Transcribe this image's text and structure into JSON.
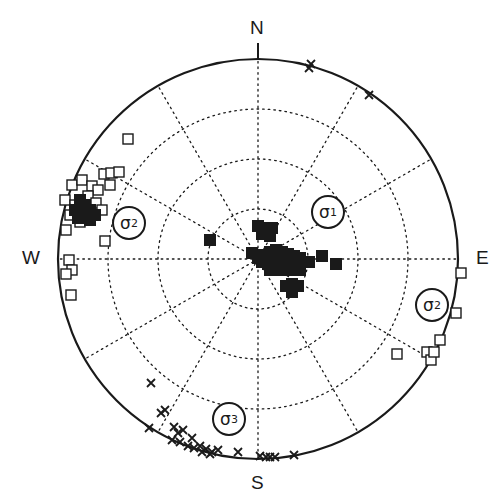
{
  "diagram": {
    "type": "stereonet",
    "projection": "lower-hemisphere equal-area",
    "center": [
      258,
      259
    ],
    "radius": 200,
    "grid_rings": [
      50,
      100,
      150
    ],
    "grid_spoke_step_deg": 30,
    "colors": {
      "ink": "#1a1a1a",
      "background": "#ffffff"
    }
  },
  "labels": {
    "north": "N",
    "south": "S",
    "east": "E",
    "west": "W"
  },
  "stress_labels": [
    {
      "id": "sigma1",
      "symbol": "σ",
      "sub": "1",
      "x": 328,
      "y": 212
    },
    {
      "id": "sigma2-west",
      "symbol": "σ",
      "sub": "2",
      "x": 129,
      "y": 223
    },
    {
      "id": "sigma2-east",
      "symbol": "σ",
      "sub": "2",
      "x": 432,
      "y": 305
    },
    {
      "id": "sigma3",
      "symbol": "σ",
      "sub": "3",
      "x": 229,
      "y": 419
    }
  ],
  "legend_markers": {
    "square": "open square (sigma1/sigma2 axes)",
    "cross": "cross (sigma3 axes)"
  },
  "points": {
    "squares_open": [
      [
        128,
        139
      ],
      [
        104,
        174
      ],
      [
        111,
        173
      ],
      [
        119,
        172
      ],
      [
        110,
        185
      ],
      [
        72,
        185
      ],
      [
        82,
        180
      ],
      [
        92,
        186
      ],
      [
        98,
        190
      ],
      [
        88,
        196
      ],
      [
        65,
        200
      ],
      [
        75,
        205
      ],
      [
        96,
        203
      ],
      [
        102,
        210
      ],
      [
        70,
        215
      ],
      [
        80,
        222
      ],
      [
        66,
        230
      ],
      [
        105,
        241
      ],
      [
        69,
        260
      ],
      [
        72,
        270
      ],
      [
        66,
        274
      ],
      [
        71,
        295
      ],
      [
        461,
        273
      ],
      [
        456,
        313
      ],
      [
        440,
        340
      ],
      [
        427,
        352
      ],
      [
        431,
        360
      ],
      [
        397,
        354
      ],
      [
        434,
        352
      ]
    ],
    "squares_dense_cluster": [
      [
        80,
        200
      ],
      [
        85,
        205
      ],
      [
        90,
        210
      ],
      [
        85,
        215
      ],
      [
        90,
        220
      ],
      [
        75,
        210
      ],
      [
        95,
        215
      ],
      [
        78,
        218
      ],
      [
        258,
        226
      ],
      [
        265,
        228
      ],
      [
        272,
        228
      ],
      [
        262,
        234
      ],
      [
        270,
        236
      ],
      [
        210,
        240
      ],
      [
        252,
        253
      ],
      [
        258,
        258
      ],
      [
        264,
        255
      ],
      [
        270,
        252
      ],
      [
        276,
        250
      ],
      [
        282,
        252
      ],
      [
        288,
        254
      ],
      [
        294,
        256
      ],
      [
        300,
        258
      ],
      [
        262,
        262
      ],
      [
        268,
        264
      ],
      [
        275,
        262
      ],
      [
        281,
        262
      ],
      [
        288,
        262
      ],
      [
        295,
        264
      ],
      [
        302,
        262
      ],
      [
        270,
        270
      ],
      [
        278,
        270
      ],
      [
        286,
        270
      ],
      [
        294,
        270
      ],
      [
        300,
        270
      ],
      [
        286,
        286
      ],
      [
        292,
        284
      ],
      [
        298,
        286
      ],
      [
        292,
        292
      ],
      [
        322,
        256
      ],
      [
        336,
        264
      ],
      [
        309,
        262
      ]
    ],
    "crosses": [
      [
        311,
        64
      ],
      [
        309,
        68
      ],
      [
        369,
        95
      ],
      [
        151,
        383
      ],
      [
        161,
        413
      ],
      [
        165,
        410
      ],
      [
        174,
        427
      ],
      [
        178,
        433
      ],
      [
        183,
        430
      ],
      [
        192,
        438
      ],
      [
        149,
        428
      ],
      [
        172,
        440
      ],
      [
        180,
        442
      ],
      [
        188,
        446
      ],
      [
        194,
        448
      ],
      [
        200,
        446
      ],
      [
        206,
        449
      ],
      [
        212,
        452
      ],
      [
        218,
        450
      ],
      [
        202,
        452
      ],
      [
        210,
        454
      ],
      [
        238,
        452
      ],
      [
        260,
        456
      ],
      [
        266,
        457
      ],
      [
        270,
        457
      ],
      [
        275,
        457
      ],
      [
        294,
        455
      ]
    ]
  }
}
